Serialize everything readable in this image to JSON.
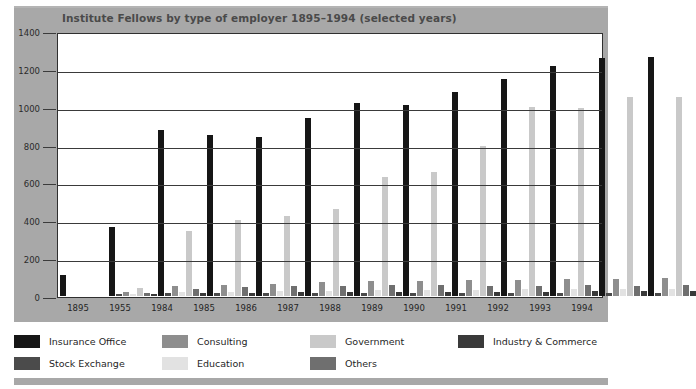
{
  "chart_data": {
    "type": "bar",
    "title": "Institute Fellows by type of employer 1895–1994 (selected years)",
    "xlabel": "",
    "ylabel": "",
    "ylim": [
      0,
      1400
    ],
    "yticks": [
      0,
      200,
      400,
      600,
      800,
      1000,
      1200,
      1400
    ],
    "grid": true,
    "legend_position": "bottom",
    "categories": [
      "1895",
      "1955",
      "1984",
      "1985",
      "1986",
      "1987",
      "1988",
      "1989",
      "1990",
      "1991",
      "1992",
      "1993",
      "1994"
    ],
    "series": [
      {
        "name": "Insurance Office",
        "color": "#161616",
        "values": [
          110,
          365,
          885,
          855,
          845,
          950,
          1025,
          1015,
          1085,
          1155,
          1225,
          1265,
          1270
        ]
      },
      {
        "name": "Stock Exchange",
        "color": "#4b4b4b",
        "values": [
          0,
          10,
          15,
          15,
          15,
          15,
          15,
          15,
          15,
          15,
          15,
          15,
          15
        ]
      },
      {
        "name": "Consulting",
        "color": "#8e8e8e",
        "values": [
          0,
          20,
          55,
          60,
          65,
          75,
          80,
          80,
          85,
          85,
          90,
          90,
          95
        ]
      },
      {
        "name": "Education",
        "color": "#e2e2e2",
        "values": [
          0,
          10,
          20,
          20,
          25,
          25,
          30,
          30,
          30,
          35,
          35,
          40,
          40
        ]
      },
      {
        "name": "Government",
        "color": "#c9c9c9",
        "values": [
          0,
          45,
          345,
          405,
          425,
          465,
          635,
          660,
          800,
          1005,
          1000,
          1060,
          1060
        ]
      },
      {
        "name": "Others",
        "color": "#6f6f6f",
        "values": [
          0,
          15,
          40,
          50,
          55,
          55,
          60,
          60,
          55,
          55,
          60,
          55,
          60
        ]
      },
      {
        "name": "Industry & Commerce",
        "color": "#3a3a3a",
        "values": [
          0,
          10,
          15,
          15,
          20,
          20,
          20,
          20,
          20,
          20,
          25,
          25,
          25
        ]
      }
    ]
  },
  "legend": {
    "row1": [
      "Insurance Office",
      "Consulting",
      "Government",
      "Industry & Commerce"
    ],
    "row2": [
      "Stock Exchange",
      "Education",
      "Others",
      ""
    ]
  },
  "colors": {
    "panel": "#a8a8a8",
    "plot_background": "#ffffff",
    "axis": "#2f2f2f",
    "title_text": "#4a4a4a"
  }
}
